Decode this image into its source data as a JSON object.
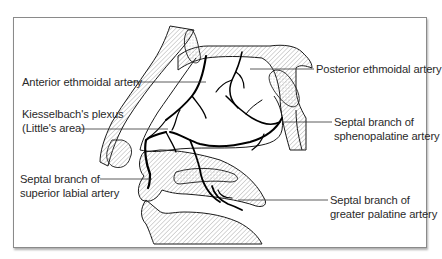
{
  "figure": {
    "frame": {
      "border_color": "#8a8a8a",
      "background": "#ffffff"
    },
    "line_color": "#1a1a1a",
    "artery_color": "#000000",
    "hatch_color": "#9a9a9a"
  },
  "labels": {
    "anterior_ethmoidal": {
      "lines": [
        "Anterior ethmoidal artery"
      ]
    },
    "kiesselbach": {
      "lines": [
        "Kiesselbach's plexus",
        "(Little's area)"
      ]
    },
    "superior_labial": {
      "lines": [
        "Septal branch of",
        "superior labial artery"
      ]
    },
    "posterior_ethmoidal": {
      "lines": [
        "Posterior ethmoidal artery"
      ]
    },
    "sphenopalatine": {
      "lines": [
        "Septal branch of",
        "sphenopalatine artery"
      ]
    },
    "greater_palatine": {
      "lines": [
        "Septal branch of",
        "greater palatine artery"
      ]
    }
  }
}
